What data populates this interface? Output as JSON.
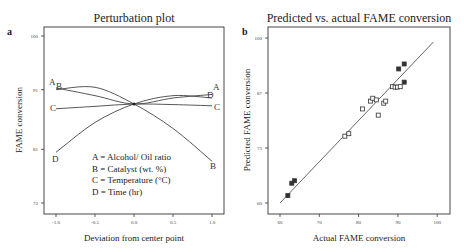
{
  "chart_data": [
    {
      "panel_label": "a",
      "type": "line",
      "title": "Perturbation plot",
      "xlabel": "Deviation from center point",
      "ylabel": "FAME conversion",
      "xlim": [
        -1.0,
        1.0
      ],
      "ylim": [
        72,
        100
      ],
      "xticks": [
        "-1.0",
        "-0.5",
        "0.0",
        "0.5",
        "1.0"
      ],
      "yticks": [
        "100",
        "91",
        "81",
        "72"
      ],
      "grid": false,
      "x": [
        -1.0,
        -0.5,
        0.0,
        0.5,
        1.0
      ],
      "series": [
        {
          "name": "A",
          "label": "A = Alcohol/ Oil ratio",
          "values": [
            91.3,
            90.0,
            88.6,
            89.6,
            90.2
          ]
        },
        {
          "name": "B",
          "label": "B =  Catalyst (wt. %)",
          "values": [
            91.0,
            91.4,
            88.6,
            84.5,
            79.0
          ]
        },
        {
          "name": "C",
          "label": "C = Temperature (°C)",
          "values": [
            87.8,
            88.2,
            88.6,
            88.5,
            88.3
          ]
        },
        {
          "name": "D",
          "label": "D = Time (hr)",
          "values": [
            80.5,
            85.5,
            88.6,
            90.0,
            89.6
          ]
        }
      ],
      "legend": [
        "A = Alcohol/ Oil ratio",
        "B =  Catalyst (wt. %)",
        "C = Temperature (°C)",
        "D = Time (hr)"
      ],
      "legend_position": "inside-bottom-center"
    },
    {
      "panel_label": "b",
      "type": "scatter",
      "title": "Predicted vs. actual FAME conversion",
      "xlabel": "Actual FAME conversion",
      "ylabel": "Predicted FAME conversion",
      "xlim": [
        60,
        100
      ],
      "ylim": [
        60,
        100
      ],
      "xticks": [
        "60",
        "70",
        "80",
        "90",
        "100"
      ],
      "yticks": [
        "100",
        "87",
        "73",
        "60"
      ],
      "grid": false,
      "reference_line": {
        "x": [
          60,
          99
        ],
        "y": [
          60,
          99
        ]
      },
      "points": [
        {
          "x": 62.0,
          "y": 61.8
        },
        {
          "x": 63.0,
          "y": 64.8
        },
        {
          "x": 63.7,
          "y": 65.4
        },
        {
          "x": 76.5,
          "y": 76.2
        },
        {
          "x": 77.5,
          "y": 76.8
        },
        {
          "x": 81.0,
          "y": 82.8
        },
        {
          "x": 83.0,
          "y": 84.7
        },
        {
          "x": 83.6,
          "y": 85.4
        },
        {
          "x": 84.5,
          "y": 85.0
        },
        {
          "x": 85.0,
          "y": 81.3
        },
        {
          "x": 86.4,
          "y": 84.2
        },
        {
          "x": 86.9,
          "y": 84.7
        },
        {
          "x": 88.6,
          "y": 88.2
        },
        {
          "x": 89.3,
          "y": 88.1
        },
        {
          "x": 89.9,
          "y": 88.1
        },
        {
          "x": 90.6,
          "y": 88.2
        },
        {
          "x": 90.2,
          "y": 92.5
        },
        {
          "x": 91.6,
          "y": 89.3
        },
        {
          "x": 91.6,
          "y": 93.7
        }
      ]
    }
  ],
  "ui": {
    "panel_a_tag": "a",
    "panel_b_tag": "b"
  }
}
